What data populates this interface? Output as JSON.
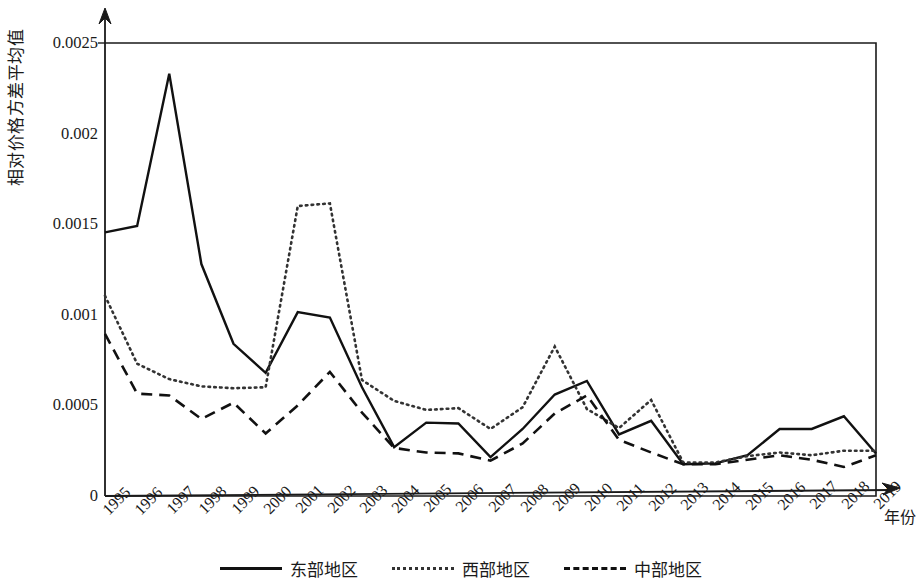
{
  "chart_data": {
    "type": "line",
    "title": "",
    "xlabel": "年份",
    "ylabel": "相对价格方差平均值",
    "x": [
      1995,
      1996,
      1997,
      1998,
      1999,
      2000,
      2001,
      2002,
      2003,
      2004,
      2005,
      2006,
      2007,
      2008,
      2009,
      2010,
      2011,
      2012,
      2013,
      2014,
      2015,
      2016,
      2017,
      2018,
      2019
    ],
    "categories": [
      "1995",
      "1996",
      "1997",
      "1998",
      "1999",
      "2000",
      "2001",
      "2002",
      "2003",
      "2004",
      "2005",
      "2006",
      "2007",
      "2008",
      "2009",
      "2010",
      "2011",
      "2012",
      "2013",
      "2014",
      "2015",
      "2016",
      "2017",
      "2018",
      "2019"
    ],
    "ylim": [
      0,
      0.0025
    ],
    "yticks": [
      0,
      0.0005,
      0.001,
      0.0015,
      0.002,
      0.0025
    ],
    "ytick_labels": [
      "0",
      "0.0005",
      "0.001",
      "0.0015",
      "0.002",
      "0.0025"
    ],
    "grid": false,
    "legend_position": "bottom",
    "series": [
      {
        "name": "东部地区",
        "style": "solid",
        "color": "#111111",
        "values": [
          0.001455,
          0.00149,
          0.00233,
          0.00128,
          0.00084,
          0.00068,
          0.001015,
          0.000985,
          0.0006,
          0.00027,
          0.000405,
          0.0004,
          0.000215,
          0.00037,
          0.00056,
          0.000635,
          0.00034,
          0.000415,
          0.000175,
          0.00018,
          0.000225,
          0.00037,
          0.00037,
          0.00044,
          0.000235
        ]
      },
      {
        "name": "西部地区",
        "style": "dotted",
        "color": "#333333",
        "values": [
          0.001105,
          0.00073,
          0.000645,
          0.000605,
          0.000595,
          0.0006,
          0.0016,
          0.001615,
          0.00064,
          0.000525,
          0.000475,
          0.000485,
          0.00037,
          0.00049,
          0.000825,
          0.00048,
          0.000375,
          0.00053,
          0.000185,
          0.000185,
          0.00022,
          0.00024,
          0.000225,
          0.00025,
          0.00025
        ]
      },
      {
        "name": "中部地区",
        "style": "dashed",
        "color": "#111111",
        "values": [
          0.000895,
          0.000565,
          0.000555,
          0.000425,
          0.000515,
          0.000345,
          0.0005,
          0.000685,
          0.00046,
          0.000265,
          0.00024,
          0.000235,
          0.000195,
          0.00029,
          0.000455,
          0.000555,
          0.00031,
          0.00024,
          0.000175,
          0.000175,
          0.0002,
          0.000225,
          0.0002,
          0.00016,
          0.000225
        ]
      }
    ]
  },
  "legend": {
    "items": [
      {
        "label": "东部地区",
        "style": "solid"
      },
      {
        "label": "西部地区",
        "style": "dotted"
      },
      {
        "label": "中部地区",
        "style": "dashed"
      }
    ]
  },
  "axes": {
    "y_title": "相对价格方差平均值",
    "x_title": "年份"
  }
}
